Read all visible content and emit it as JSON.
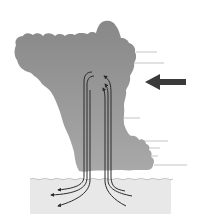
{
  "diagram": {
    "colors": {
      "background": "#ffffff",
      "cloud_top": "#8a8a8a",
      "cloud_bottom": "#a8a8a8",
      "water": "#e8e8e8",
      "water_line": "#b8b8b8",
      "arrows": "#2a2a2a",
      "wind_lines": "#b0b0b0",
      "big_arrow": "#3a3a3a"
    },
    "elements": {
      "cloud": "storm-cloud",
      "central_flow": "updraft-downdraft-arrows",
      "surface_outflow": "outflow-arrows",
      "steering_wind": "large-left-arrow",
      "wind_lines": "horizontal-wind-lines",
      "surface": "water-surface"
    },
    "wind_line_rows": [
      52,
      63,
      118,
      141,
      148,
      156,
      165
    ]
  }
}
